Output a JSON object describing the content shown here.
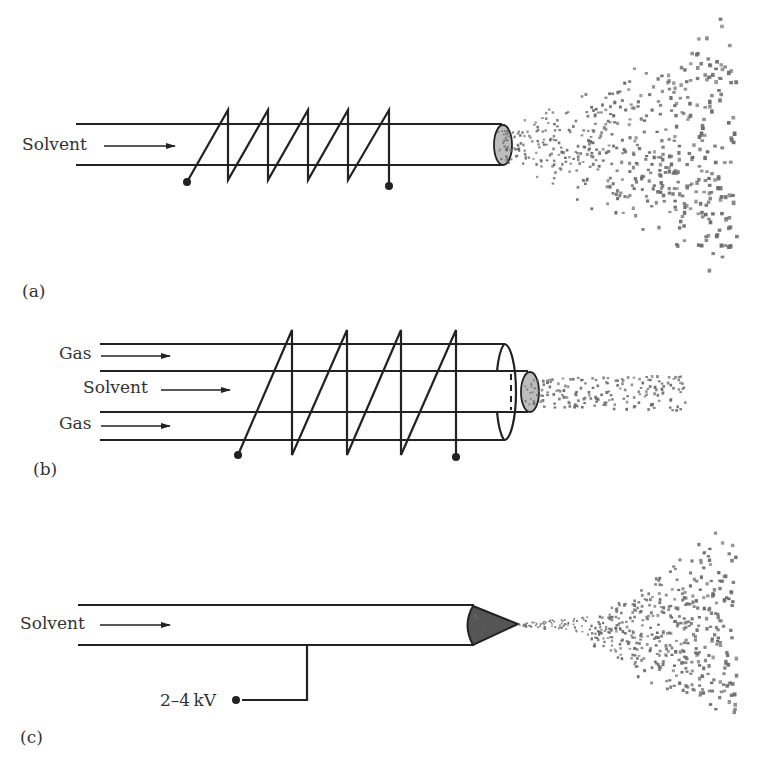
{
  "figure": {
    "panels": [
      {
        "id": "a",
        "label": "(a)",
        "description": "Thermospray: heated capillary with coil, producing wide spray",
        "inputs": [
          {
            "text": "Solvent"
          }
        ]
      },
      {
        "id": "b",
        "label": "(b)",
        "description": "Pneumatically assisted spray: coaxial gas flow around solvent with heated coil, narrow plume",
        "inputs": [
          {
            "text": "Gas"
          },
          {
            "text": "Solvent"
          },
          {
            "text": "Gas"
          }
        ]
      },
      {
        "id": "c",
        "label": "(c)",
        "description": "Electrospray: capillary held at high voltage forming Taylor cone and spray",
        "inputs": [
          {
            "text": "Solvent"
          }
        ],
        "voltage": "2–4 kV"
      }
    ]
  },
  "colors": {
    "line": "#222222",
    "text": "#333333",
    "droplet": "#6b6b6b",
    "cone_fill": "#555555"
  }
}
